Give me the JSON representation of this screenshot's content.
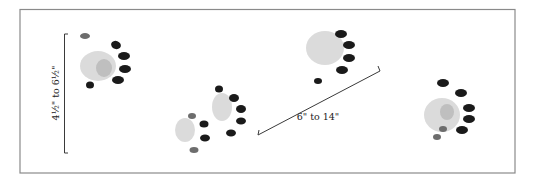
{
  "figure": {
    "measurements": {
      "track_length_label": "4½\" to 6½\"",
      "stride_label": "6\" to 14\""
    },
    "track_count": 5,
    "colors": {
      "frame": "#8a8a8a",
      "ink": "#1a1a1a",
      "pad": "#cfcfcf"
    }
  }
}
